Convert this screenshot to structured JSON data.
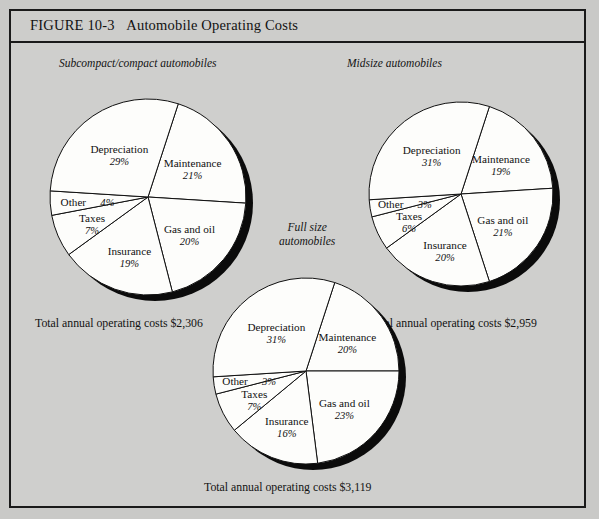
{
  "figure": {
    "number": "FIGURE 10-3",
    "title": "Automobile Operating Costs"
  },
  "charts": [
    {
      "id": "subcompact",
      "label": "Subcompact/compact automobiles",
      "total_caption": "Total annual operating costs $2,306",
      "total_value": "$2,306",
      "slices": [
        {
          "name": "Maintenance",
          "pct": 21,
          "pct_label": "21%"
        },
        {
          "name": "Gas and oil",
          "pct": 20,
          "pct_label": "20%"
        },
        {
          "name": "Insurance",
          "pct": 19,
          "pct_label": "19%"
        },
        {
          "name": "Taxes",
          "pct": 7,
          "pct_label": "7%"
        },
        {
          "name": "Other",
          "pct": 4,
          "pct_label": "4%"
        },
        {
          "name": "Depreciation",
          "pct": 29,
          "pct_label": "29%"
        }
      ]
    },
    {
      "id": "midsize",
      "label": "Midsize automobiles",
      "total_caption": "Total annual operating costs $2,959",
      "total_value": "$2,959",
      "slices": [
        {
          "name": "Maintenance",
          "pct": 19,
          "pct_label": "19%"
        },
        {
          "name": "Gas and oil",
          "pct": 21,
          "pct_label": "21%"
        },
        {
          "name": "Insurance",
          "pct": 20,
          "pct_label": "20%"
        },
        {
          "name": "Taxes",
          "pct": 6,
          "pct_label": "6%"
        },
        {
          "name": "Other",
          "pct": 3,
          "pct_label": "3%"
        },
        {
          "name": "Depreciation",
          "pct": 31,
          "pct_label": "31%"
        }
      ]
    },
    {
      "id": "fullsize",
      "label": "Full size\nautomobiles",
      "total_caption": "Total annual operating costs $3,119",
      "total_value": "$3,119",
      "slices": [
        {
          "name": "Maintenance",
          "pct": 20,
          "pct_label": "20%"
        },
        {
          "name": "Gas and oil",
          "pct": 23,
          "pct_label": "23%"
        },
        {
          "name": "Insurance",
          "pct": 16,
          "pct_label": "16%"
        },
        {
          "name": "Taxes",
          "pct": 7,
          "pct_label": "7%"
        },
        {
          "name": "Other",
          "pct": 3,
          "pct_label": "3%"
        },
        {
          "name": "Depreciation",
          "pct": 31,
          "pct_label": "31%"
        }
      ]
    }
  ],
  "chart_data": [
    {
      "type": "pie",
      "title": "Subcompact/compact automobiles",
      "annotation": "Total annual operating costs $2,306",
      "categories": [
        "Maintenance",
        "Gas and oil",
        "Insurance",
        "Taxes",
        "Other",
        "Depreciation"
      ],
      "values": [
        21,
        20,
        19,
        7,
        4,
        29
      ],
      "unit": "percent",
      "start_angle_deg": 18,
      "direction": "clockwise",
      "legend": "none",
      "labels_inside": true
    },
    {
      "type": "pie",
      "title": "Midsize automobiles",
      "annotation": "Total annual operating costs $2,959",
      "categories": [
        "Maintenance",
        "Gas and oil",
        "Insurance",
        "Taxes",
        "Other",
        "Depreciation"
      ],
      "values": [
        19,
        21,
        20,
        6,
        3,
        31
      ],
      "unit": "percent",
      "start_angle_deg": 18,
      "direction": "clockwise",
      "legend": "none",
      "labels_inside": true
    },
    {
      "type": "pie",
      "title": "Full size automobiles",
      "annotation": "Total annual operating costs $3,119",
      "categories": [
        "Maintenance",
        "Gas and oil",
        "Insurance",
        "Taxes",
        "Other",
        "Depreciation"
      ],
      "values": [
        20,
        23,
        16,
        7,
        3,
        31
      ],
      "unit": "percent",
      "start_angle_deg": 18,
      "direction": "clockwise",
      "legend": "none",
      "labels_inside": true
    }
  ]
}
